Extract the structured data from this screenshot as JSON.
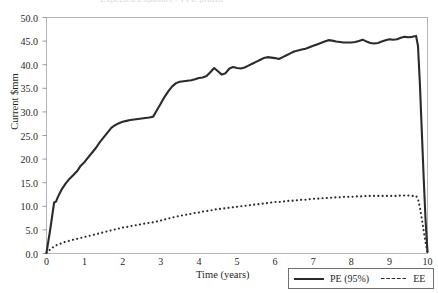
{
  "figure": {
    "clipped_title": "Expected Exposure / PFE profile",
    "background_color": "#ffffff",
    "frame_color": "#b4b4bc"
  },
  "axes": {
    "y_title": "Current $mm",
    "x_title": "Time (years)",
    "y_ticks": [
      "0.0",
      "5.0",
      "10.0",
      "15.0",
      "20.0",
      "25.0",
      "30.0",
      "35.0",
      "40.0",
      "45.0",
      "50.0"
    ],
    "x_ticks": [
      "0",
      "1",
      "2",
      "3",
      "4",
      "5",
      "6",
      "7",
      "8",
      "9",
      "10"
    ]
  },
  "legend": {
    "items": [
      {
        "label": "PE (95%)",
        "style": "solid",
        "color": "#2b2b2b"
      },
      {
        "label": "EE",
        "style": "dotted",
        "color": "#2b2b2b"
      }
    ]
  },
  "chart_data": {
    "type": "line",
    "title": "Expected Exposure / PFE profile",
    "xlabel": "Time (years)",
    "ylabel": "Current $mm",
    "xlim": [
      0,
      10
    ],
    "ylim": [
      0,
      50
    ],
    "grid": false,
    "legend_position": "bottom-right",
    "x": [
      0.0,
      0.1,
      0.2,
      0.25,
      0.3,
      0.4,
      0.5,
      0.6,
      0.7,
      0.8,
      0.9,
      1.0,
      1.1,
      1.2,
      1.3,
      1.4,
      1.5,
      1.6,
      1.7,
      1.8,
      1.9,
      2.0,
      2.1,
      2.2,
      2.3,
      2.4,
      2.5,
      2.6,
      2.7,
      2.8,
      2.9,
      3.0,
      3.1,
      3.2,
      3.3,
      3.4,
      3.5,
      3.6,
      3.7,
      3.8,
      3.9,
      4.0,
      4.1,
      4.2,
      4.3,
      4.4,
      4.5,
      4.6,
      4.7,
      4.8,
      4.9,
      5.0,
      5.1,
      5.2,
      5.3,
      5.4,
      5.5,
      5.6,
      5.7,
      5.8,
      5.9,
      6.0,
      6.1,
      6.2,
      6.3,
      6.4,
      6.5,
      6.6,
      6.7,
      6.8,
      6.9,
      7.0,
      7.1,
      7.2,
      7.3,
      7.4,
      7.5,
      7.6,
      7.7,
      7.8,
      7.9,
      8.0,
      8.1,
      8.2,
      8.3,
      8.4,
      8.5,
      8.6,
      8.7,
      8.8,
      8.9,
      9.0,
      9.1,
      9.2,
      9.3,
      9.4,
      9.5,
      9.6,
      9.7,
      9.75,
      9.8,
      9.85,
      9.9,
      9.95,
      10.0
    ],
    "series": [
      {
        "name": "PE (95%)",
        "style": "solid",
        "color": "#2b2b2b",
        "values": [
          0.2,
          5.2,
          10.8,
          11.0,
          12.0,
          13.6,
          14.8,
          15.8,
          16.6,
          17.4,
          18.6,
          19.4,
          20.4,
          21.4,
          22.4,
          23.6,
          24.6,
          25.6,
          26.6,
          27.2,
          27.6,
          27.9,
          28.1,
          28.3,
          28.4,
          28.5,
          28.6,
          28.7,
          28.8,
          29.0,
          30.4,
          31.8,
          33.2,
          34.4,
          35.4,
          36.1,
          36.4,
          36.5,
          36.6,
          36.7,
          36.9,
          37.2,
          37.3,
          37.6,
          38.4,
          39.3,
          38.6,
          37.9,
          38.2,
          39.2,
          39.5,
          39.3,
          39.2,
          39.4,
          39.8,
          40.2,
          40.6,
          41.0,
          41.4,
          41.6,
          41.5,
          41.4,
          41.2,
          41.6,
          42.0,
          42.4,
          42.8,
          43.0,
          43.2,
          43.4,
          43.7,
          44.0,
          44.3,
          44.6,
          44.9,
          45.2,
          45.1,
          44.9,
          44.8,
          44.7,
          44.7,
          44.7,
          44.8,
          45.0,
          45.3,
          44.9,
          44.6,
          44.5,
          44.6,
          44.9,
          45.2,
          45.4,
          45.3,
          45.4,
          45.7,
          45.9,
          45.8,
          45.9,
          46.1,
          44.0,
          36.0,
          26.0,
          16.0,
          7.0,
          0.3
        ]
      },
      {
        "name": "EE",
        "style": "dotted",
        "color": "#2b2b2b",
        "values": [
          0.1,
          0.9,
          1.5,
          1.7,
          1.9,
          2.2,
          2.5,
          2.7,
          2.9,
          3.1,
          3.3,
          3.5,
          3.7,
          3.9,
          4.1,
          4.3,
          4.5,
          4.7,
          4.9,
          5.1,
          5.3,
          5.5,
          5.6,
          5.8,
          5.9,
          6.1,
          6.2,
          6.4,
          6.5,
          6.6,
          6.8,
          7.0,
          7.2,
          7.4,
          7.6,
          7.8,
          8.0,
          8.1,
          8.3,
          8.4,
          8.6,
          8.7,
          8.9,
          9.0,
          9.1,
          9.3,
          9.4,
          9.5,
          9.6,
          9.7,
          9.8,
          9.9,
          10.0,
          10.1,
          10.2,
          10.3,
          10.4,
          10.5,
          10.6,
          10.7,
          10.8,
          10.9,
          10.9,
          11.0,
          11.1,
          11.2,
          11.2,
          11.3,
          11.4,
          11.4,
          11.5,
          11.6,
          11.6,
          11.7,
          11.7,
          11.8,
          11.8,
          11.9,
          11.9,
          12.0,
          12.0,
          12.0,
          12.1,
          12.1,
          12.1,
          12.2,
          12.2,
          12.2,
          12.2,
          12.2,
          12.2,
          12.2,
          12.2,
          12.2,
          12.3,
          12.3,
          12.3,
          12.2,
          12.2,
          11.6,
          9.8,
          7.4,
          4.8,
          2.3,
          0.3
        ]
      }
    ]
  }
}
